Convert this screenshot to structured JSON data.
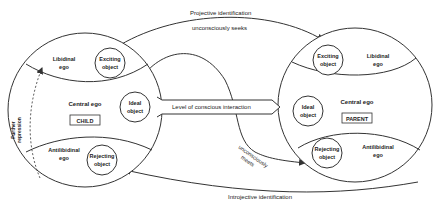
{
  "arrows": {
    "projective": "Projective identification",
    "seeks": "unconsciously seeks",
    "meets_line1": "unconsciously",
    "meets_line2": "meets",
    "introjective": "Introjective identification",
    "conscious": "Level of conscious interaction",
    "repression_line1": "Further",
    "repression_line2": "repression"
  },
  "child": {
    "libidinal_ego_1": "Libidinal",
    "libidinal_ego_2": "ego",
    "exciting_1": "Exciting",
    "exciting_2": "object",
    "central_ego": "Central ego",
    "label": "CHILD",
    "ideal_1": "Ideal",
    "ideal_2": "object",
    "antilibidinal_1": "Antilibidinal",
    "antilibidinal_2": "ego",
    "rejecting_1": "Rejecting",
    "rejecting_2": "object"
  },
  "parent": {
    "exciting_1": "Exciting",
    "exciting_2": "object",
    "libidinal_ego_1": "Libidinal",
    "libidinal_ego_2": "ego",
    "ideal_1": "Ideal",
    "ideal_2": "object",
    "central_ego": "Central ego",
    "label": "PARENT",
    "rejecting_1": "Rejecting",
    "rejecting_2": "object",
    "antilibidinal_1": "Antilibidinal",
    "antilibidinal_2": "ego"
  },
  "colors": {
    "stroke": "#333333",
    "text": "#222222"
  }
}
